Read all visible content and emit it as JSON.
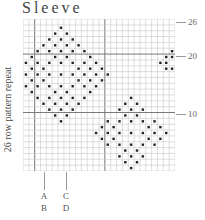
{
  "title": "Sleeve",
  "side_label": "26 row pattern repeat",
  "chart_data": {
    "type": "table",
    "title": "Sleeve",
    "rows": 26,
    "cols": 26,
    "row_markers": [
      {
        "label": "26",
        "row": 26
      },
      {
        "label": "20",
        "row": 20
      },
      {
        "label": "10",
        "row": 10
      }
    ],
    "guide_lines": [
      {
        "labels": [
          "A",
          "B"
        ],
        "col": 3
      },
      {
        "labels": [
          "C",
          "D"
        ],
        "col": 7
      }
    ],
    "heavy_lines": {
      "vertical_after_cols": [
        2,
        14
      ],
      "horizontal_after_rows": [
        6,
        16
      ]
    },
    "colors": {
      "grid": "#c8c8c8",
      "heavy": "#777777",
      "dot": "#222222"
    }
  },
  "row_marker_labels": {
    "r26": "26",
    "r20": "20",
    "r10": "10"
  },
  "guide_labels": {
    "a": "A",
    "b": "B",
    "c": "C",
    "d": "D"
  }
}
